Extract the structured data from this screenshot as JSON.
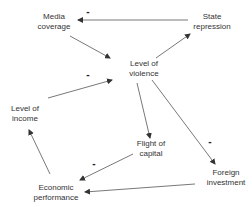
{
  "diagram": {
    "type": "causal-loop",
    "colors": {
      "edge": "#444444",
      "text": "#333333",
      "background": "#ffffff"
    },
    "nodes": [
      {
        "id": "media",
        "lines": [
          "Media",
          "coverage"
        ],
        "x": 54,
        "y": 12
      },
      {
        "id": "state",
        "lines": [
          "State",
          "repression"
        ],
        "x": 212,
        "y": 12
      },
      {
        "id": "violence",
        "lines": [
          "Level of",
          "violence"
        ],
        "x": 144,
        "y": 59
      },
      {
        "id": "income",
        "lines": [
          "Level of",
          "income"
        ],
        "x": 25,
        "y": 104
      },
      {
        "id": "flight",
        "lines": [
          "Flight of",
          "capital"
        ],
        "x": 151,
        "y": 139
      },
      {
        "id": "economic",
        "lines": [
          "Economic",
          "performance"
        ],
        "x": 56,
        "y": 183
      },
      {
        "id": "foreign",
        "lines": [
          "Foreign",
          "investment"
        ],
        "x": 226,
        "y": 168
      }
    ],
    "edges": [
      {
        "from": "state",
        "to": "media",
        "sign": "-"
      },
      {
        "from": "media",
        "to": "violence",
        "sign": ""
      },
      {
        "from": "violence",
        "to": "state",
        "sign": ""
      },
      {
        "from": "income",
        "to": "violence",
        "sign": "-"
      },
      {
        "from": "violence",
        "to": "flight",
        "sign": ""
      },
      {
        "from": "violence",
        "to": "foreign",
        "sign": "-"
      },
      {
        "from": "flight",
        "to": "economic",
        "sign": "-"
      },
      {
        "from": "foreign",
        "to": "economic",
        "sign": ""
      },
      {
        "from": "economic",
        "to": "income",
        "sign": ""
      }
    ],
    "signs": [
      {
        "text": "-",
        "x": 88,
        "y": 8
      },
      {
        "text": "-",
        "x": 88,
        "y": 71
      },
      {
        "text": "-",
        "x": 210,
        "y": 138
      },
      {
        "text": "-",
        "x": 94,
        "y": 160
      }
    ]
  }
}
